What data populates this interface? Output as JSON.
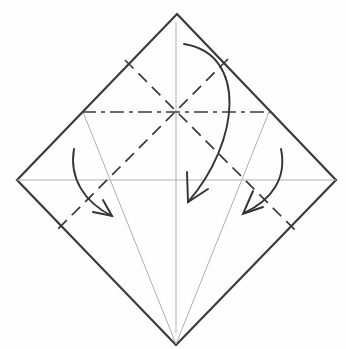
{
  "diagram": {
    "kind": "origami-fold-step",
    "canvas": {
      "width": 346,
      "height": 349,
      "background": "#fefefe"
    },
    "colors": {
      "outline": "#3a3a3a",
      "crease": "#b0b0b0",
      "fold": "#3a3a3a",
      "arrow": "#333333",
      "paper_fill": "#fefefe"
    },
    "paper": {
      "name": "paper-diamond-outline",
      "points": "177,14 336,180 176,345 17,180",
      "stroke_width": 2.2
    },
    "creases": [
      {
        "name": "center-vertical-crease",
        "x1": 176,
        "y1": 22,
        "x2": 176,
        "y2": 333,
        "width": 1
      },
      {
        "name": "center-horizontal-crease",
        "x1": 17,
        "y1": 180,
        "x2": 336,
        "y2": 180,
        "width": 1
      },
      {
        "name": "left-kite-crease",
        "x1": 83,
        "y1": 112,
        "x2": 176,
        "y2": 344,
        "width": 1
      },
      {
        "name": "right-kite-crease",
        "x1": 269,
        "y1": 112,
        "x2": 176,
        "y2": 344,
        "width": 1
      }
    ],
    "folds": [
      {
        "name": "valley-fold-line-nw-se",
        "x1": 125,
        "y1": 60,
        "x2": 295,
        "y2": 230,
        "dash": "12 7",
        "width": 1.7
      },
      {
        "name": "valley-fold-line-ne-sw",
        "x1": 228,
        "y1": 59,
        "x2": 56,
        "y2": 231,
        "dash": "12 7",
        "width": 1.7
      },
      {
        "name": "mountain-fold-line-horizontal",
        "x1": 82,
        "y1": 112,
        "x2": 270,
        "y2": 112,
        "dash": "14 5 4 5",
        "width": 1.7
      }
    ],
    "arrows": [
      {
        "name": "fold-arrow-top-corner-down",
        "path": "M 184 44 C 248 54 240 142 188 202",
        "head": "187,172 188,202 208,189",
        "width": 1.9
      },
      {
        "name": "fold-arrow-left-corner-in",
        "path": "M 74 149 C 69 178 84 202 112 216",
        "head": "103,200 112,216 93,212",
        "width": 1.9
      },
      {
        "name": "fold-arrow-right-corner-in",
        "path": "M 281 149 C 287 178 272 200 244 213",
        "head": "253,191 243,214 263,207",
        "width": 1.9
      }
    ]
  }
}
